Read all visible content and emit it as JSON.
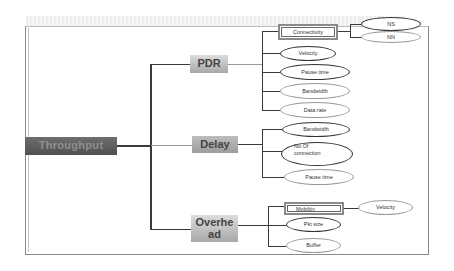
{
  "diagram": {
    "root": {
      "label": "Throughput"
    },
    "branches": [
      {
        "label": "PDR",
        "children": [
          {
            "label": "Connectivity",
            "shape": "rectangle",
            "children": [
              {
                "label": "NS",
                "shape": "ellipse"
              },
              {
                "label": "NN",
                "shape": "ellipse"
              }
            ]
          },
          {
            "label": "Velocity",
            "shape": "ellipse"
          },
          {
            "label": "Pause time",
            "shape": "ellipse"
          },
          {
            "label": "Bandwidth",
            "shape": "ellipse"
          },
          {
            "label": "Data rate",
            "shape": "ellipse"
          }
        ]
      },
      {
        "label": "Delay",
        "children": [
          {
            "label": "Bandwidth",
            "shape": "ellipse"
          },
          {
            "label": "No Of connection",
            "line1": "No Of",
            "line2": "connection",
            "shape": "ellipse"
          },
          {
            "label": "Pause time",
            "shape": "ellipse"
          }
        ]
      },
      {
        "label": "Overhead",
        "line1": "Overhe",
        "line2": "ad",
        "children": [
          {
            "label": "Mobility",
            "shape": "rectangle",
            "children": [
              {
                "label": "Velocity",
                "shape": "ellipse"
              }
            ]
          },
          {
            "label": "Pkt size",
            "shape": "ellipse"
          },
          {
            "label": "Buffer",
            "shape": "ellipse"
          }
        ]
      }
    ]
  },
  "colors": {
    "root_fill": "#5a5a5a",
    "level1_fill": "#b0b0b0",
    "line": "#3a3a3a",
    "frame": "#8a8a8a"
  }
}
